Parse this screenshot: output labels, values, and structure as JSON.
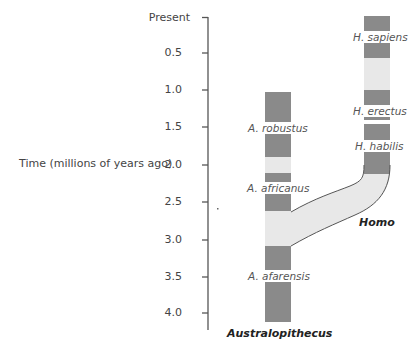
{
  "axis": {
    "title": "Time (millions of years ago)",
    "ticks": [
      {
        "label": "Present",
        "value": 0.0
      },
      {
        "label": "0.5",
        "value": 0.5
      },
      {
        "label": "1.0",
        "value": 1.0
      },
      {
        "label": "1.5",
        "value": 1.5
      },
      {
        "label": "2.0",
        "value": 2.0
      },
      {
        "label": "2.5",
        "value": 2.5
      },
      {
        "label": "3.0",
        "value": 3.0
      },
      {
        "label": "3.5",
        "value": 3.5
      },
      {
        "label": "4.0",
        "value": 4.0
      }
    ]
  },
  "lineages": {
    "australopithecus": {
      "genus_label": "Australopithecus",
      "species": [
        {
          "name": "A. robustus"
        },
        {
          "name": "A. africanus"
        },
        {
          "name": "A. afarensis"
        }
      ]
    },
    "homo": {
      "genus_label": "Homo",
      "species": [
        {
          "name": "H. sapiens"
        },
        {
          "name": "H. erectus"
        },
        {
          "name": "H. habilis"
        }
      ]
    }
  },
  "colors": {
    "dark_segment": "#8a8a8a",
    "light_segment": "#e8e8e8",
    "outline": "#555555",
    "axis": "#555555",
    "text": "#444444"
  }
}
